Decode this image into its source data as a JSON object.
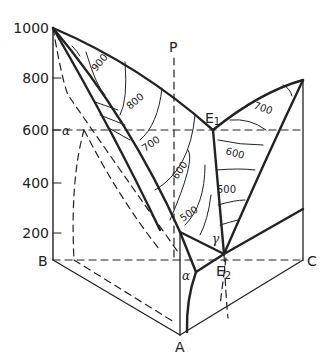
{
  "diagram": {
    "type": "ternary-eutectic-phase-diagram-3d",
    "temperature_axis": {
      "ticks": [
        "1000",
        "800",
        "600",
        "400",
        "200"
      ]
    },
    "corners": {
      "a": "A",
      "b": "B",
      "c": "C"
    },
    "points": {
      "p": "P",
      "e1": "E",
      "e1_sub": "1",
      "e2": "E",
      "e2_sub": "2"
    },
    "phase_labels": {
      "alpha_axis": "α",
      "alpha_base": "α",
      "gamma": "γ"
    },
    "isotherms": {
      "left_surface": [
        "900",
        "800",
        "700",
        "600",
        "500"
      ],
      "right_surface": [
        "700",
        "600",
        "500"
      ]
    }
  }
}
